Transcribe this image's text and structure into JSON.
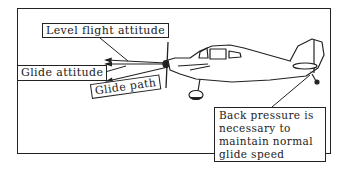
{
  "diagram": {
    "labels": {
      "level_flight_attitude": "Level flight attitude",
      "glide_attitude": "Glide attitude",
      "glide_path": "Glide path"
    },
    "callout": {
      "lines": [
        "Back pressure is",
        "necessary to",
        "maintain normal",
        "glide speed"
      ]
    },
    "colors": {
      "ink": "#222222",
      "background": "#ffffff"
    }
  }
}
